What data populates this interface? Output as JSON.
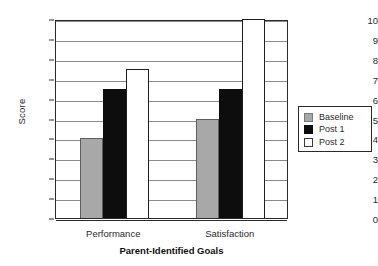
{
  "chart_data": {
    "type": "bar",
    "title": "",
    "xlabel": "Parent-Identified Goals",
    "ylabel": "Score",
    "categories": [
      "Performance",
      "Satisfaction"
    ],
    "series": [
      {
        "name": "Baseline",
        "values": [
          4,
          5
        ],
        "color": "#a8a8a8"
      },
      {
        "name": "Post 1",
        "values": [
          6.5,
          6.5
        ],
        "color": "#0d0d0d"
      },
      {
        "name": "Post 2",
        "values": [
          7.5,
          10
        ],
        "color": "#ffffff"
      }
    ],
    "ylim": [
      0,
      10
    ],
    "yticks": [
      0,
      1,
      2,
      3,
      4,
      5,
      6,
      7,
      8,
      9,
      10
    ],
    "ytick_labels": [
      "0",
      "1",
      "2",
      "3",
      "4",
      "5",
      "6",
      "7",
      "8",
      "9",
      "10"
    ],
    "grid": true,
    "legend_position": "right"
  }
}
